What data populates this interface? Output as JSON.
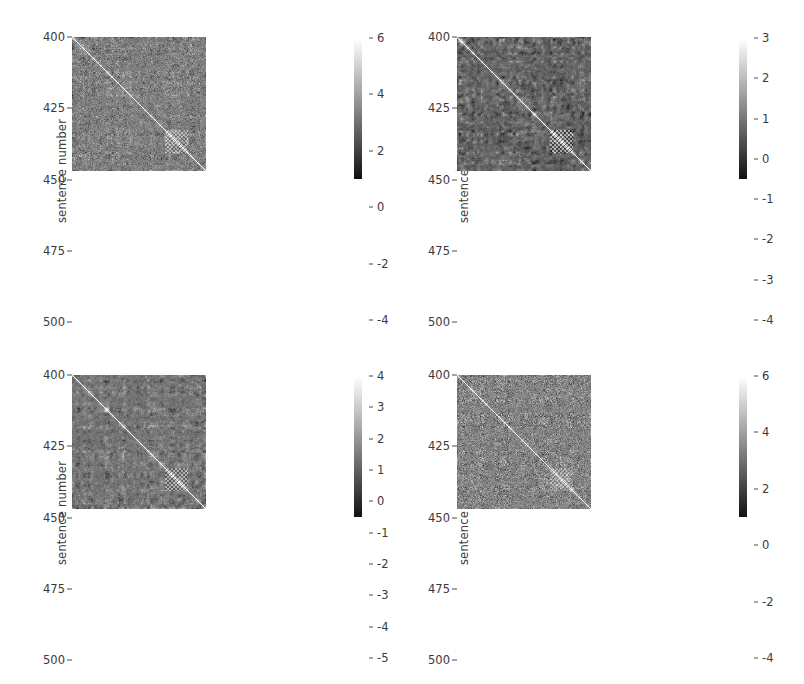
{
  "figure": {
    "width": 804,
    "height": 684,
    "background": "#ffffff",
    "layout": "2x2 grid of heatmap panels, each with its own vertical colorbar"
  },
  "chart_data": [
    {
      "id": "panel-top-left",
      "type": "heatmap",
      "title": "",
      "xlabel": "",
      "ylabel": "sentence number",
      "ytick_labels": [
        "400",
        "425",
        "450",
        "475",
        "500"
      ],
      "ytick_values": [
        400,
        425,
        450,
        475,
        500
      ],
      "ylim": [
        400,
        500
      ],
      "xlim": [
        400,
        500
      ],
      "xtick_labels": [],
      "grid": false,
      "colormap": "gray",
      "colorbar": {
        "position": "right",
        "vmin": -4,
        "vmax": 6,
        "tick_labels": [
          "6",
          "4",
          "2",
          "0",
          "-2",
          "-4"
        ],
        "tick_values": [
          6,
          4,
          2,
          0,
          -2,
          -4
        ]
      },
      "notes": "Self-similarity matrix, bright unit diagonal, blocky texture, strong dark/bright block near sentences 470-485",
      "seed": 101,
      "contrast": 0.3,
      "diag_bright": true,
      "block_strength": 0.55,
      "noise": 0.42
    },
    {
      "id": "panel-top-right",
      "type": "heatmap",
      "title": "",
      "xlabel": "",
      "ylabel": "sentence number",
      "ytick_labels": [
        "400",
        "425",
        "450",
        "475",
        "500"
      ],
      "ytick_values": [
        400,
        425,
        450,
        475,
        500
      ],
      "ylim": [
        400,
        500
      ],
      "xlim": [
        400,
        500
      ],
      "xtick_labels": [],
      "grid": false,
      "colormap": "gray",
      "colorbar": {
        "position": "right",
        "vmin": -4,
        "vmax": 3,
        "tick_labels": [
          "3",
          "2",
          "1",
          "0",
          "-1",
          "-2",
          "-3",
          "-4"
        ],
        "tick_values": [
          3,
          2,
          1,
          0,
          -1,
          -2,
          -3,
          -4
        ]
      },
      "notes": "High contrast blocky banding, bright column band near sentence 470, bright square near 472-478",
      "seed": 202,
      "contrast": 0.62,
      "diag_bright": true,
      "block_strength": 1.0,
      "noise": 0.2
    },
    {
      "id": "panel-bottom-left",
      "type": "heatmap",
      "title": "",
      "xlabel": "",
      "ylabel": "sentence number",
      "ytick_labels": [
        "400",
        "425",
        "450",
        "475",
        "500"
      ],
      "ytick_values": [
        400,
        425,
        450,
        475,
        500
      ],
      "ylim": [
        400,
        500
      ],
      "xlim": [
        400,
        500
      ],
      "xtick_labels": [],
      "grid": false,
      "colormap": "gray",
      "colorbar": {
        "position": "right",
        "vmin": -5,
        "vmax": 4,
        "tick_labels": [
          "4",
          "3",
          "2",
          "1",
          "0",
          "-1",
          "-2",
          "-3",
          "-4",
          "-5"
        ],
        "tick_values": [
          4,
          3,
          2,
          1,
          0,
          -1,
          -2,
          -3,
          -4,
          -5
        ]
      },
      "notes": "Medium contrast blocky texture, bright block near sentences 468-478",
      "seed": 303,
      "contrast": 0.5,
      "diag_bright": true,
      "block_strength": 0.85,
      "noise": 0.28
    },
    {
      "id": "panel-bottom-right",
      "type": "heatmap",
      "title": "",
      "xlabel": "",
      "ylabel": "sentence number",
      "ytick_labels": [
        "400",
        "425",
        "450",
        "475",
        "500"
      ],
      "ytick_values": [
        400,
        425,
        450,
        475,
        500
      ],
      "ylim": [
        400,
        500
      ],
      "xlim": [
        400,
        500
      ],
      "xtick_labels": [],
      "grid": false,
      "colormap": "gray",
      "colorbar": {
        "position": "right",
        "vmin": -4,
        "vmax": 6,
        "tick_labels": [
          "6",
          "4",
          "2",
          "0",
          "-2",
          "-4"
        ],
        "tick_values": [
          6,
          4,
          2,
          0,
          -2,
          -4
        ]
      },
      "notes": "Low contrast flat field, sparse bright speckles, checkerboard bright patch near sentences 470-478",
      "seed": 404,
      "contrast": 0.22,
      "diag_bright": true,
      "block_strength": 0.35,
      "noise": 0.52
    }
  ],
  "panels": [
    {
      "key": "panel-top-left",
      "index": 0
    },
    {
      "key": "panel-top-right",
      "index": 1
    },
    {
      "key": "panel-bottom-left",
      "index": 2
    },
    {
      "key": "panel-bottom-right",
      "index": 3
    }
  ],
  "colors": {
    "axis_text": "#3a3a3a",
    "tick_mark": "#4a4a4a",
    "background": "#ffffff",
    "cmap_low": "#000000",
    "cmap_high": "#ffffff"
  }
}
